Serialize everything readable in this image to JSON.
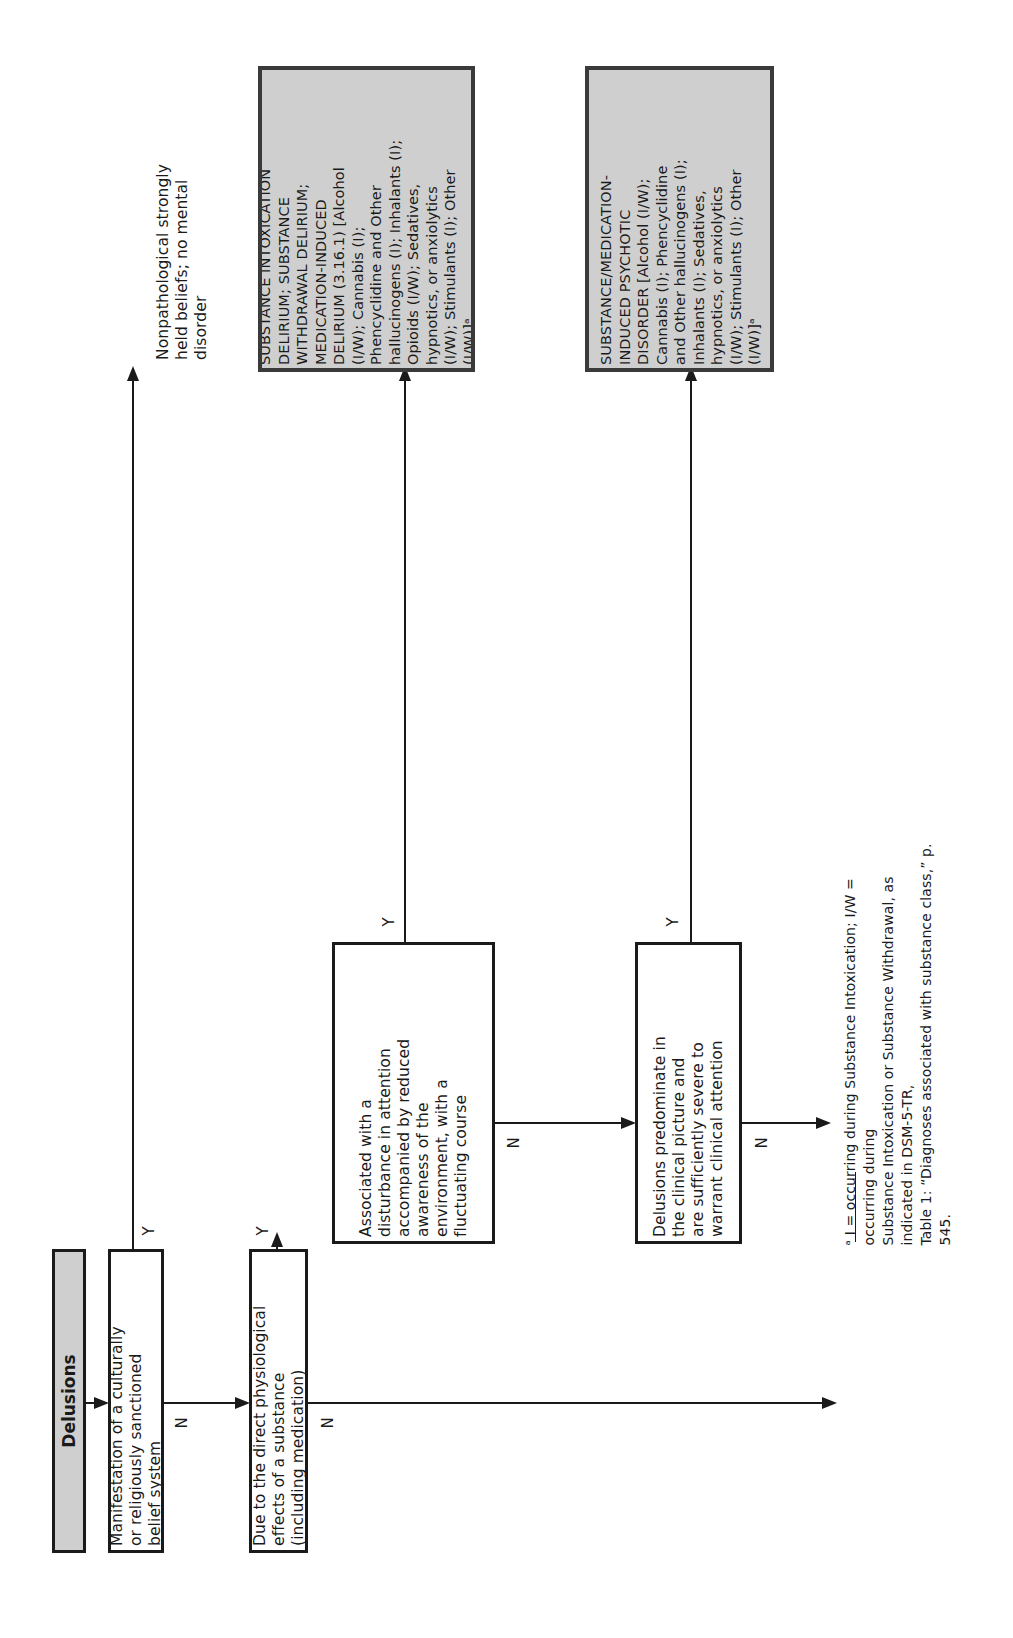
{
  "diagram": {
    "start": {
      "label": "Delusions"
    },
    "decisions": [
      {
        "id": "cultural",
        "text": "Manifestation of a culturally\nor religiously sanctioned\nbelief system",
        "yes_label": "Y",
        "no_label": "N"
      },
      {
        "id": "substance",
        "text": "Due to the direct physiological\neffects of a substance\n(including medication)",
        "yes_label": "Y",
        "no_label": "N"
      },
      {
        "id": "attention",
        "text": "Associated with a\ndisturbance in attention\naccompanied by reduced\nawareness of the\nenvironment, with a\nfluctuating course",
        "yes_label": "Y",
        "no_label": "N"
      },
      {
        "id": "predominate",
        "text": "Delusions predominate in\nthe clinical picture and\nare sufficiently severe to\nwarrant clinical attention",
        "yes_label": "Y",
        "no_label": "N"
      }
    ],
    "outcomes": [
      {
        "id": "nonpathological",
        "text": "Nonpathological strongly\nheld beliefs; no mental\ndisorder"
      },
      {
        "id": "delirium",
        "text": "SUBSTANCE INTOXICATION\nDELIRIUM; SUBSTANCE\nWITHDRAWAL DELIRIUM;\nMEDICATION-INDUCED\nDELIRIUM (3.16.1) [Alcohol\n(I/W); Cannabis (I);\nPhencyclidine and Other\nhallucinogens (I); Inhalants (I);\nOpioids (I/W); Sedatives,\nhypnotics, or anxiolytics\n(I/W); Stimulants (I); Other\n(I/W)]ᵃ"
      },
      {
        "id": "psychotic",
        "text": "SUBSTANCE/MEDICATION-\nINDUCED PSYCHOTIC\nDISORDER [Alcohol (I/W);\nCannabis (I); Phencyclidine\nand Other hallucinogens (I);\nInhalants (I); Sedatives,\nhypnotics, or anxiolytics\n(I/W); Stimulants (I); Other\n(I/W)]ᵃ"
      }
    ],
    "footnote": "ᵃ I = occurring during Substance Intoxication; I/W = occurring during\nSubstance Intoxication or Substance Withdrawal, as indicated in DSM-5-TR,\nTable 1: “Diagnoses associated with substance class,” p. 545."
  },
  "colors": {
    "line": "#1a1a1a",
    "outcome_fill": "#cfcfcf",
    "outcome_border": "#3a3a3a",
    "start_fill": "#cfcfcf"
  }
}
